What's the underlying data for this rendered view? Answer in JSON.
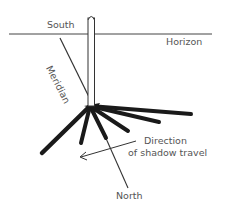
{
  "diagram": {
    "labels": {
      "south": "South",
      "horizon": "Horizon",
      "meridian": "Meridian",
      "direction_line1": "Direction",
      "direction_line2": "of shadow travel",
      "north": "North"
    },
    "colors": {
      "line": "#333333",
      "shadow": "#1a1a1a",
      "text": "#555555"
    }
  }
}
